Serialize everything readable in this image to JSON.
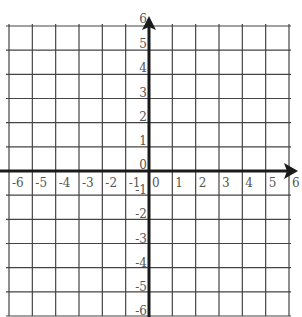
{
  "chart_data": {
    "type": "coordinate-grid",
    "title": "",
    "xlabel": "",
    "ylabel": "",
    "xlim": [
      -6,
      6
    ],
    "ylim": [
      -6,
      6
    ],
    "grid": true,
    "x_tick_labels": [
      "-6",
      "-5",
      "-4",
      "-3",
      "-2",
      "-1",
      "0",
      "1",
      "2",
      "3",
      "4",
      "5",
      "6"
    ],
    "y_tick_labels": [
      "6",
      "5",
      "4",
      "3",
      "2",
      "1",
      "0",
      "-1",
      "-2",
      "-3",
      "-4",
      "-5",
      "-6"
    ],
    "axes": {
      "x_arrow": "positive",
      "y_arrow": "positive"
    }
  },
  "colors": {
    "grid": "#444444",
    "axis": "#1a1a1a",
    "label": "#555555",
    "background": "#ffffff"
  },
  "geometry": {
    "left": 9,
    "right": 289,
    "top": 26,
    "bottom": 316,
    "origin_x": 149,
    "origin_y": 171
  }
}
